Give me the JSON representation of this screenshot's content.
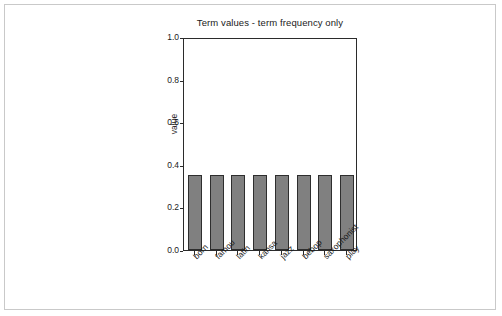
{
  "chart_data": {
    "type": "bar",
    "title": "Term values - term frequency only",
    "xlabel": "",
    "ylabel": "value",
    "categories": [
      "born",
      "famou",
      "latin",
      "kansa",
      "jazz",
      "bebop",
      "saxophonist",
      "play"
    ],
    "values": [
      0.354,
      0.354,
      0.354,
      0.354,
      0.354,
      0.354,
      0.354,
      0.354
    ],
    "ylim": [
      0.0,
      1.0
    ],
    "ytick_labels": [
      "0.0",
      "0.2",
      "0.4",
      "0.6",
      "0.8",
      "1.0"
    ],
    "ytick_values": [
      0.0,
      0.2,
      0.4,
      0.6,
      0.8,
      1.0
    ],
    "grid": false,
    "legend": false,
    "bar_color": "#808080",
    "bar_edge_color": "#2e2e2e",
    "axis_color": "#2b2b2b",
    "background_color": "#ffffff",
    "frame_color": "#c9c9c9",
    "xtick_label_rotation": -45
  }
}
